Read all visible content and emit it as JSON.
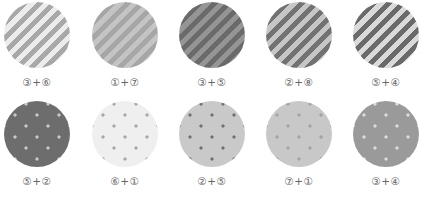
{
  "swatches": [
    {
      "label": "③+⑥",
      "pattern": "stripes",
      "base": "#ececec",
      "mark": "#a8a8a8",
      "row": 0,
      "col": 0
    },
    {
      "label": "①+⑦",
      "pattern": "stripes",
      "base": "#c4c4c4",
      "mark": "#a6a6a6",
      "row": 0,
      "col": 1
    },
    {
      "label": "③+⑤",
      "pattern": "stripes",
      "base": "#959595",
      "mark": "#6a6a6a",
      "row": 0,
      "col": 2
    },
    {
      "label": "②+⑧",
      "pattern": "stripes",
      "base": "#c6c6c6",
      "mark": "#727272",
      "row": 0,
      "col": 3
    },
    {
      "label": "⑤+④",
      "pattern": "stripes",
      "base": "#dadada",
      "mark": "#6a6a6a",
      "row": 0,
      "col": 4
    },
    {
      "label": "⑤+②",
      "pattern": "dots",
      "base": "#6d6d6d",
      "mark": "#c8c8c8",
      "row": 1,
      "col": 0
    },
    {
      "label": "⑥+①",
      "pattern": "dots",
      "base": "#efefef",
      "mark": "#a8a8a8",
      "row": 1,
      "col": 1
    },
    {
      "label": "②+⑤",
      "pattern": "dots",
      "base": "#c9c9c9",
      "mark": "#727272",
      "row": 1,
      "col": 2
    },
    {
      "label": "⑦+①",
      "pattern": "dots",
      "base": "#c8c8c8",
      "mark": "#a4a4a4",
      "row": 1,
      "col": 3
    },
    {
      "label": "③+④",
      "pattern": "dots",
      "base": "#9a9a9a",
      "mark": "#dcdcdc",
      "row": 1,
      "col": 4
    }
  ]
}
